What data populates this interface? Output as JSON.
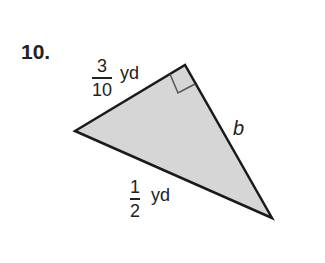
{
  "problem": {
    "number": "10.",
    "sides": {
      "leg_top": {
        "numerator": "3",
        "denominator": "10",
        "unit": "yd"
      },
      "hypotenuse": {
        "numerator": "1",
        "denominator": "2",
        "unit": "yd"
      },
      "leg_right": {
        "label": "b"
      }
    },
    "fill_color": "#d6d6d6",
    "stroke_color": "#1a1a1a"
  }
}
